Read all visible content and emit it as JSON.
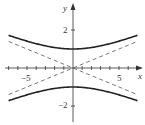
{
  "chart_data": {
    "type": "line",
    "title": "",
    "xlabel": "x",
    "ylabel": "y",
    "xlim": [
      -7,
      7.3
    ],
    "ylim": [
      -3.0,
      3.4
    ],
    "x_ticks": [
      -7,
      -6,
      -5,
      -4,
      -3,
      -2,
      -1,
      1,
      2,
      3,
      4,
      5,
      6,
      7
    ],
    "x_tick_labels": [
      {
        "value": -5,
        "label": "−5"
      },
      {
        "value": 5,
        "label": "5"
      }
    ],
    "y_ticks": [
      2,
      -2
    ],
    "y_tick_labels": [
      {
        "value": 2,
        "label": "2"
      },
      {
        "value": -2,
        "label": "−2"
      }
    ],
    "grid": false,
    "series": [
      {
        "name": "hyperbola upper branch",
        "equation": "y = sqrt(1 + x^2/25)",
        "style": "solid",
        "x": [
          -7,
          -5,
          -3,
          -1,
          0,
          1,
          3,
          5,
          7
        ],
        "y": [
          1.72,
          1.41,
          1.17,
          1.02,
          1.0,
          1.02,
          1.17,
          1.41,
          1.72
        ]
      },
      {
        "name": "hyperbola lower branch",
        "equation": "y = -sqrt(1 + x^2/25)",
        "style": "solid",
        "x": [
          -7,
          -5,
          -3,
          -1,
          0,
          1,
          3,
          5,
          7
        ],
        "y": [
          -1.72,
          -1.41,
          -1.17,
          -1.02,
          -1.0,
          -1.02,
          -1.17,
          -1.41,
          -1.72
        ]
      },
      {
        "name": "asymptote y = x/5",
        "style": "dashed",
        "x": [
          -7,
          7
        ],
        "y": [
          -1.4,
          1.4
        ]
      },
      {
        "name": "asymptote y = -x/5",
        "style": "dashed",
        "x": [
          -7,
          7
        ],
        "y": [
          1.4,
          -1.4
        ]
      }
    ]
  },
  "labels": {
    "x_axis": "x",
    "y_axis": "y",
    "x_neg5": "−5",
    "x_pos5": "5",
    "y_pos2": "2",
    "y_neg2": "−2"
  }
}
